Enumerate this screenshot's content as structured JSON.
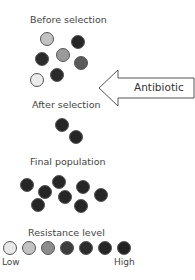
{
  "sections": {
    "before": {
      "label": "Before selection"
    },
    "after": {
      "label": "After selection"
    },
    "final": {
      "label": "Final population"
    },
    "scale": {
      "label": "Resistance level",
      "low": "Low",
      "high": "High"
    }
  },
  "arrow": {
    "label": "Antibiotic"
  },
  "colors": {
    "level1": "#e8e8e8",
    "level2": "#c2c2c2",
    "level3": "#8c8c8c",
    "level4": "#3c3c3c",
    "level5": "#2c2c2c",
    "level6": "#262626",
    "level7": "#222222",
    "outline": "#555555"
  }
}
